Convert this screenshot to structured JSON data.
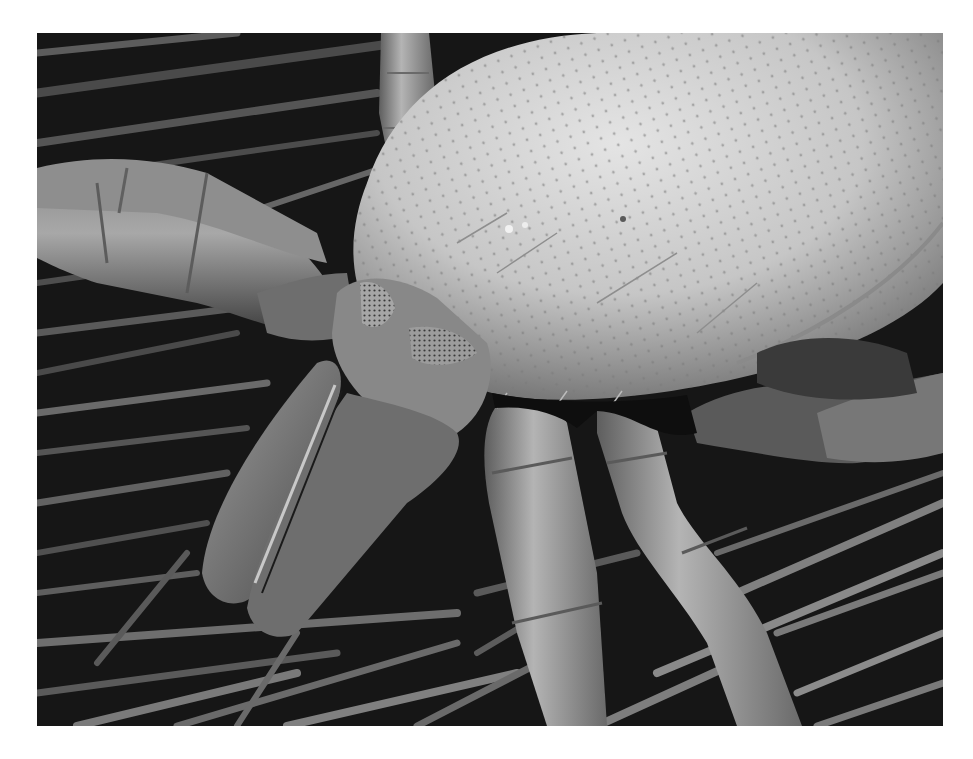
{
  "image": {
    "kind": "scanning electron micrograph",
    "subject": "mite on a mat of fibers",
    "palette": {
      "background": "#ffffff",
      "fiber_dark": "#141414",
      "fiber_mid": "#5a5a5a",
      "fiber_light": "#9a9a9a",
      "body_light": "#d2d2d2",
      "body_mid": "#a8a8a8",
      "shadow": "#0a0a0a"
    },
    "regions": [
      {
        "name": "idiosoma",
        "description": "large dimpled dorsal shield, upper right"
      },
      {
        "name": "gnathosoma",
        "description": "mouthparts with two porous areae, center-left"
      },
      {
        "name": "chelicerae",
        "description": "elongated paired mouthparts, lower left"
      },
      {
        "name": "leg-front-left",
        "description": "segmented leg extending left, upper left"
      },
      {
        "name": "legs-front-center",
        "description": "two segmented legs extending downward"
      },
      {
        "name": "leg-right",
        "description": "leg extending right beneath shield"
      },
      {
        "name": "fiber-mat",
        "description": "tangle of long thin fibers as substrate"
      }
    ]
  }
}
